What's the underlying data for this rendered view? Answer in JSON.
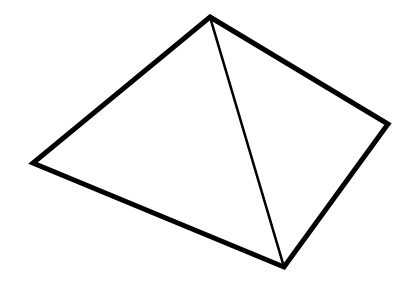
{
  "figure": {
    "name": "pyramid-line-drawing",
    "canvas": {
      "width": 403,
      "height": 292,
      "background_color": "#ffffff"
    },
    "stroke": {
      "color": "#000000",
      "outline_width": 5,
      "inner_edge_width": 2.6,
      "linejoin": "miter",
      "linecap": "round",
      "fill": "none"
    },
    "vertices": [
      {
        "name": "apex",
        "label": "apex",
        "x": 210,
        "y": 17
      },
      {
        "name": "left-base-corner",
        "label": "left",
        "x": 33,
        "y": 163
      },
      {
        "name": "front-base-corner",
        "label": "bottom",
        "x": 284,
        "y": 267
      },
      {
        "name": "right-base-corner",
        "label": "right",
        "x": 388,
        "y": 124
      }
    ],
    "outline_path": "M 210 17 L 388 124 L 284 267 L 33 163 Z",
    "inner_edge_path": "M 210 17 L 284 267",
    "faces": [
      {
        "name": "left-face",
        "label": "left face",
        "path": "M 210 17 L 284 267 L 33 163 Z",
        "fill": "#ffffff"
      },
      {
        "name": "right-face",
        "label": "right face",
        "path": "M 210 17 L 388 124 L 284 267 Z",
        "fill": "#ffffff"
      }
    ],
    "edges": [
      {
        "name": "edge-apex-to-right",
        "from": "apex",
        "to": "right-base-corner",
        "kind": "outline"
      },
      {
        "name": "edge-right-to-bottom",
        "from": "right-base-corner",
        "to": "front-base-corner",
        "kind": "outline"
      },
      {
        "name": "edge-bottom-to-left",
        "from": "front-base-corner",
        "to": "left-base-corner",
        "kind": "outline"
      },
      {
        "name": "edge-left-to-apex",
        "from": "left-base-corner",
        "to": "apex",
        "kind": "outline"
      },
      {
        "name": "edge-apex-to-bottom",
        "from": "apex",
        "to": "front-base-corner",
        "kind": "inner"
      }
    ]
  }
}
